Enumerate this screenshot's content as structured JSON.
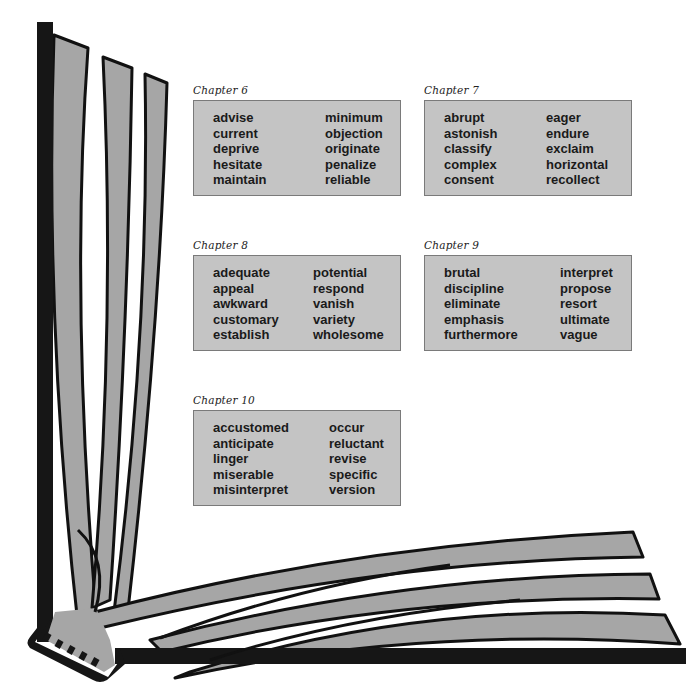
{
  "colors": {
    "page_gray": "#a6a6a6",
    "box_fill": "#c4c4c4",
    "box_border": "#7a7a7a",
    "ink": "#1a1a1a"
  },
  "chapters": [
    {
      "title": "Chapter 6",
      "left_words": [
        "advise",
        "current",
        "deprive",
        "hesitate",
        "maintain"
      ],
      "right_words": [
        "minimum",
        "objection",
        "originate",
        "penalize",
        "reliable"
      ]
    },
    {
      "title": "Chapter 7",
      "left_words": [
        "abrupt",
        "astonish",
        "classify",
        "complex",
        "consent"
      ],
      "right_words": [
        "eager",
        "endure",
        "exclaim",
        "horizontal",
        "recollect"
      ]
    },
    {
      "title": "Chapter 8",
      "left_words": [
        "adequate",
        "appeal",
        "awkward",
        "customary",
        "establish"
      ],
      "right_words": [
        "potential",
        "respond",
        "vanish",
        "variety",
        "wholesome"
      ]
    },
    {
      "title": "Chapter 9",
      "left_words": [
        "brutal",
        "discipline",
        "eliminate",
        "emphasis",
        "furthermore"
      ],
      "right_words": [
        "interpret",
        "propose",
        "resort",
        "ultimate",
        "vague"
      ]
    },
    {
      "title": "Chapter 10",
      "left_words": [
        "accustomed",
        "anticipate",
        "linger",
        "miserable",
        "misinterpret"
      ],
      "right_words": [
        "occur",
        "reluctant",
        "revise",
        "specific",
        "version"
      ]
    }
  ]
}
